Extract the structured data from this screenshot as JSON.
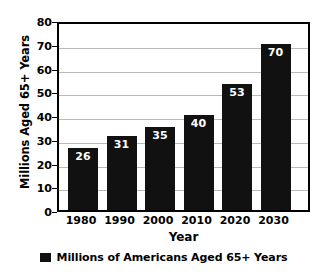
{
  "chart_data": {
    "type": "bar",
    "title": "",
    "subtitle": "",
    "xlabel": "Year",
    "ylabel": "Millions Aged 65+ Years",
    "categories": [
      "1980",
      "1990",
      "2000",
      "2010",
      "2020",
      "2030"
    ],
    "values": [
      26,
      31,
      35,
      40,
      53,
      70
    ],
    "data_labels": [
      "26",
      "31",
      "35",
      "40",
      "53",
      "70"
    ],
    "ylim": [
      0,
      80
    ],
    "yticks": [
      0,
      10,
      20,
      30,
      40,
      50,
      60,
      70,
      80
    ],
    "ytick_labels": [
      "0",
      "10",
      "20",
      "30",
      "40",
      "50",
      "60",
      "70",
      "80"
    ],
    "grid": true,
    "grid_axis": "y",
    "legend_position": "below",
    "series": [
      {
        "name": "Millions of Americans Aged 65+ Years",
        "values": [
          26,
          31,
          35,
          40,
          53,
          70
        ],
        "color": "#111111"
      }
    ],
    "colors": {
      "bar": "#111111",
      "gridline": "#b9b9b9",
      "axis": "#000000",
      "background": "#ffffff",
      "data_label_text": "#ffffff"
    }
  },
  "legend": {
    "entries": [
      {
        "label": "Millions of Americans Aged 65+ Years",
        "swatch_color": "#111111"
      }
    ]
  }
}
